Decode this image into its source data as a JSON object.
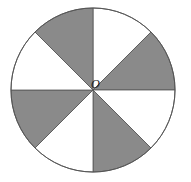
{
  "diagram": {
    "shape": "circle",
    "center": {
      "x": 93,
      "y": 90
    },
    "radius": 82,
    "sector_count": 8,
    "sector_angle_deg": 45,
    "center_label": "O",
    "colors": {
      "shaded": "#8a8a8a",
      "unshaded": "#ffffff",
      "stroke": "#555555"
    },
    "sectors": [
      {
        "index": 0,
        "from_deg": 0,
        "to_deg": 45,
        "shaded": false
      },
      {
        "index": 1,
        "from_deg": 45,
        "to_deg": 90,
        "shaded": true
      },
      {
        "index": 2,
        "from_deg": 90,
        "to_deg": 135,
        "shaded": false
      },
      {
        "index": 3,
        "from_deg": 135,
        "to_deg": 180,
        "shaded": true
      },
      {
        "index": 4,
        "from_deg": 180,
        "to_deg": 225,
        "shaded": false
      },
      {
        "index": 5,
        "from_deg": 225,
        "to_deg": 270,
        "shaded": true
      },
      {
        "index": 6,
        "from_deg": 270,
        "to_deg": 315,
        "shaded": false
      },
      {
        "index": 7,
        "from_deg": 315,
        "to_deg": 360,
        "shaded": true
      }
    ]
  }
}
